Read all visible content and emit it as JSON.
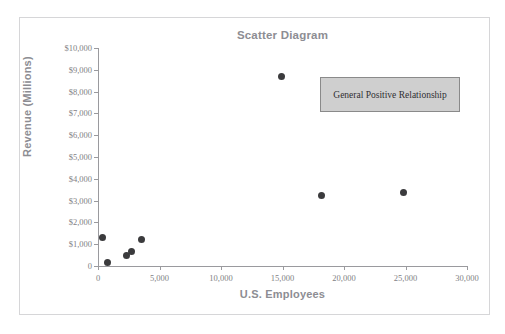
{
  "figure": {
    "top_fragment": "",
    "background_color": "#ffffff",
    "frame_color": "#d6d6d8"
  },
  "annotation": {
    "label": "General Positive Relationship",
    "fill_color": "#cfcfcf",
    "border_color": "#8a8a8a"
  },
  "chart_data": {
    "type": "scatter",
    "title": "Scatter Diagram",
    "xlabel": "U.S. Employees",
    "ylabel": "Revenue (Millions)",
    "xlim": [
      0,
      30000
    ],
    "ylim": [
      0,
      10000
    ],
    "grid": false,
    "legend": null,
    "marker_color": "#3b3b3d",
    "x_tick_labels": [
      "0",
      "5,000",
      "10,000",
      "15,000",
      "20,000",
      "25,000",
      "30,000"
    ],
    "x_tick_values": [
      0,
      5000,
      10000,
      15000,
      20000,
      25000,
      30000
    ],
    "y_tick_labels": [
      "0",
      "$1,000",
      "$2,000",
      "$3,000",
      "$4,000",
      "$5,000",
      "$6,000",
      "$7,000",
      "$8,000",
      "$9,000",
      "$10,000"
    ],
    "y_tick_values": [
      0,
      1000,
      2000,
      3000,
      4000,
      5000,
      6000,
      7000,
      8000,
      9000,
      10000
    ],
    "points": [
      {
        "x": 400,
        "y": 1320
      },
      {
        "x": 800,
        "y": 140
      },
      {
        "x": 2350,
        "y": 460
      },
      {
        "x": 2750,
        "y": 670
      },
      {
        "x": 3550,
        "y": 1220
      },
      {
        "x": 14900,
        "y": 8700
      },
      {
        "x": 18200,
        "y": 3250
      },
      {
        "x": 24800,
        "y": 3380
      }
    ],
    "annotations": [
      {
        "text": "General Positive Relationship",
        "x": 21000,
        "y": 7800
      }
    ]
  }
}
